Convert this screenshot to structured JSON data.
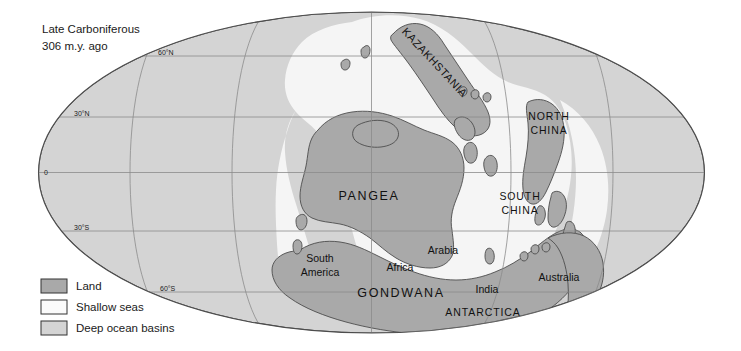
{
  "figure": {
    "title_line1": "Late Carboniferous",
    "title_line2": "306 m.y. ago",
    "projection": "elliptical-mollweide",
    "type": "paleogeographic-map"
  },
  "colors": {
    "land": "#a9a9a9",
    "shallow_seas": "#f2f2f2",
    "deep_ocean": "#d4d4d4",
    "outline": "#4d4d4d",
    "graticule": "#8c8c8c",
    "text": "#1a1a1a",
    "background": "#ffffff"
  },
  "graticule": {
    "latitudes": [
      {
        "label": "60°N",
        "x": 158,
        "y": 57
      },
      {
        "label": "30°N",
        "x": 74,
        "y": 118
      },
      {
        "label": "0",
        "x": 44,
        "y": 175
      },
      {
        "label": "30°S",
        "x": 74,
        "y": 232
      },
      {
        "label": "60°S",
        "x": 160,
        "y": 294
      }
    ]
  },
  "map_labels": [
    {
      "name": "pangea",
      "text": "PANGEA",
      "x": 369,
      "y": 196,
      "style": "big",
      "rotate": 0
    },
    {
      "name": "gondwana",
      "text": "GONDWANA",
      "x": 401,
      "y": 293,
      "style": "big",
      "rotate": 0
    },
    {
      "name": "kazakhstania",
      "text": "KAZAKHSTANIA",
      "x": 432,
      "y": 65,
      "style": "rot",
      "rotate": 47
    },
    {
      "name": "north-china",
      "text": "NORTH",
      "x": 549,
      "y": 116,
      "style": "caps",
      "rotate": 0
    },
    {
      "name": "north-china-2",
      "text": "CHINA",
      "x": 549,
      "y": 130,
      "style": "caps",
      "rotate": 0
    },
    {
      "name": "south-china",
      "text": "SOUTH",
      "x": 520,
      "y": 196,
      "style": "caps",
      "rotate": 0
    },
    {
      "name": "south-china-2",
      "text": "CHINA",
      "x": 520,
      "y": 210,
      "style": "caps",
      "rotate": 0
    },
    {
      "name": "antarctica",
      "text": "ANTARCTICA",
      "x": 483,
      "y": 312,
      "style": "caps",
      "rotate": 0
    },
    {
      "name": "south-america",
      "text": "South",
      "x": 320,
      "y": 262,
      "style": "",
      "rotate": 0
    },
    {
      "name": "south-america-2",
      "text": "America",
      "x": 320,
      "y": 276,
      "style": "",
      "rotate": 0
    },
    {
      "name": "africa",
      "text": "Africa",
      "x": 400,
      "y": 271,
      "style": "",
      "rotate": 0
    },
    {
      "name": "arabia",
      "text": "Arabia",
      "x": 443,
      "y": 254,
      "style": "",
      "rotate": 0
    },
    {
      "name": "india",
      "text": "India",
      "x": 487,
      "y": 293,
      "style": "",
      "rotate": 0
    },
    {
      "name": "australia",
      "text": "Australia",
      "x": 559,
      "y": 281,
      "style": "",
      "rotate": 0
    }
  ],
  "legend": {
    "items": [
      {
        "label": "Land",
        "swatch": "#a9a9a9"
      },
      {
        "label": "Shallow seas",
        "swatch": "#fbfbfb"
      },
      {
        "label": "Deep ocean basins",
        "swatch": "#d4d4d4"
      }
    ]
  }
}
